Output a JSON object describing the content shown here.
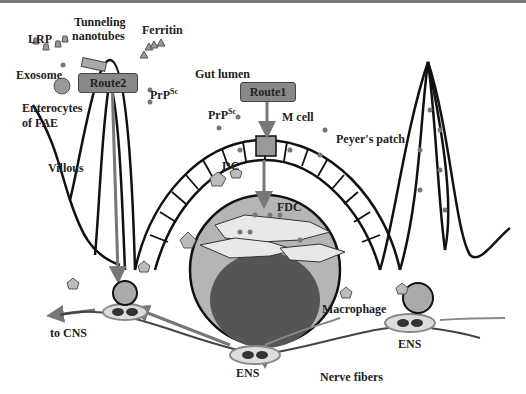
{
  "diagram": {
    "routes": [
      {
        "id": "route1",
        "label": "Route1",
        "path": "Gut lumen -> M cell -> Peyer's patch -> FDC -> ENS"
      },
      {
        "id": "route2",
        "label": "Route2",
        "path": "Enterocytes of FAE -> Villous -> ENS -> CNS"
      }
    ],
    "labels": {
      "lrp": "LRP",
      "tunneling": "Tunneling",
      "nanotubes": "nanotubes",
      "ferritin": "Ferritin",
      "exosome": "Exosome",
      "prpsc_left": "PrP",
      "prpsc_left_sup": "Sc",
      "enterocytes": "Enterocytes",
      "of_fae": "of FAE",
      "villous": "Villous",
      "gut_lumen": "Gut lumen",
      "prpsc_center": "PrP",
      "prpsc_center_sup": "Sc",
      "m_cell": "M cell",
      "peyers_patch": "Peyer's patch",
      "dc": "DC",
      "fdc": "FDC",
      "macrophage": "Macrophage",
      "to_cns": "to CNS",
      "ens_center": "ENS",
      "ens_right": "ENS",
      "nerve_fibers": "Nerve fibers"
    },
    "colors": {
      "outline": "#111111",
      "route_box": "#888888",
      "arrow": "#777777",
      "dot": "#777777",
      "follicle_light": "#b5b5b5",
      "follicle_dark": "#555555"
    }
  }
}
